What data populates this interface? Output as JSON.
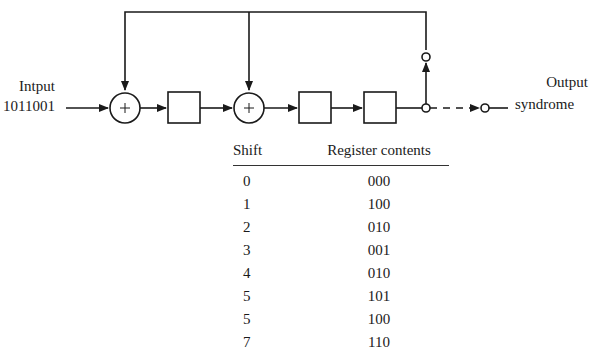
{
  "diagram": {
    "input": {
      "label": "Intput",
      "bits": "1011001"
    },
    "output": {
      "label_line1": "Output",
      "label_line2": "syndrome"
    },
    "adders": [
      {
        "symbol": "+"
      },
      {
        "symbol": "+"
      }
    ],
    "registers": 3
  },
  "table": {
    "headers": {
      "shift": "Shift",
      "contents": "Register contents"
    },
    "rows": [
      {
        "shift": "0",
        "contents": "000"
      },
      {
        "shift": "1",
        "contents": "100"
      },
      {
        "shift": "2",
        "contents": "010"
      },
      {
        "shift": "3",
        "contents": "001"
      },
      {
        "shift": "4",
        "contents": "010"
      },
      {
        "shift": "5",
        "contents": "101"
      },
      {
        "shift": "5",
        "contents": "100"
      },
      {
        "shift": "7",
        "contents": "110"
      }
    ]
  }
}
